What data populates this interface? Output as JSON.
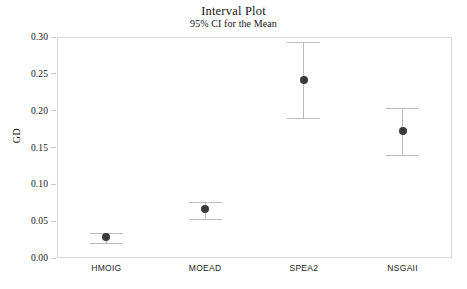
{
  "chart_data": {
    "type": "scatter",
    "title": "Interval Plot",
    "subtitle": "95% CI for the Mean",
    "xlabel": "",
    "ylabel": "GD",
    "categories": [
      "HMOIG",
      "MOEAD",
      "SPEA2",
      "NSGAII"
    ],
    "values": [
      0.028,
      0.066,
      0.241,
      0.172
    ],
    "ci_lower": [
      0.02,
      0.053,
      0.19,
      0.14
    ],
    "ci_upper": [
      0.034,
      0.076,
      0.293,
      0.204
    ],
    "ylim": [
      0.0,
      0.3
    ],
    "yticks": [
      "0.00",
      "0.05",
      "0.10",
      "0.15",
      "0.20",
      "0.25",
      "0.30"
    ],
    "ytick_values": [
      0.0,
      0.05,
      0.1,
      0.15,
      0.2,
      0.25,
      0.3
    ],
    "grid": false,
    "legend": "none",
    "series": [
      {
        "name": "GD",
        "values": [
          0.028,
          0.066,
          0.241,
          0.172
        ]
      }
    ],
    "colors": {
      "marker": "#3b3b3b",
      "whisker": "#bdbdbd",
      "frame": "#d9d9d9",
      "text": "#141414",
      "background": "#ffffff"
    }
  }
}
